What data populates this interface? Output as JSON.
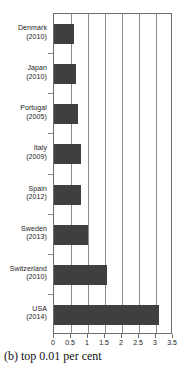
{
  "caption": "(b) top 0.01 per cent",
  "chart_data": {
    "type": "bar",
    "orientation": "horizontal",
    "title": "",
    "xlabel": "",
    "ylabel": "",
    "xlim": [
      0,
      3.5
    ],
    "xticks": [
      "0",
      "0.5",
      "1",
      "1.5",
      "2",
      "2.5",
      "3",
      "3.5"
    ],
    "xtick_values": [
      0,
      0.5,
      1,
      1.5,
      2,
      2.5,
      3,
      3.5
    ],
    "grid": true,
    "grid_axis": "x",
    "legend": "none",
    "bar_color": "#3f3f3f",
    "categories": [
      "Denmark (2010)",
      "Japan (2010)",
      "Portugal (2005)",
      "Italy (2009)",
      "Spain (2012)",
      "Sweden (2013)",
      "Switzerland (2010)",
      "USA (2014)"
    ],
    "values": [
      0.6,
      0.65,
      0.72,
      0.78,
      0.78,
      1.0,
      1.55,
      3.1
    ],
    "items": [
      {
        "country": "Denmark",
        "year": "(2010)",
        "value": 0.6
      },
      {
        "country": "Japan",
        "year": "(2010)",
        "value": 0.65
      },
      {
        "country": "Portugal",
        "year": "(2005)",
        "value": 0.72
      },
      {
        "country": "Italy",
        "year": "(2009)",
        "value": 0.78
      },
      {
        "country": "Spain",
        "year": "(2012)",
        "value": 0.78
      },
      {
        "country": "Sweden",
        "year": "(2013)",
        "value": 1.0
      },
      {
        "country": "Switzerland",
        "year": "(2010)",
        "value": 1.55
      },
      {
        "country": "USA",
        "year": "(2014)",
        "value": 3.1
      }
    ]
  }
}
